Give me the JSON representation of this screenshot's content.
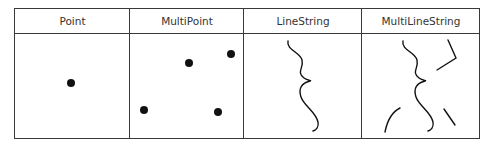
{
  "table": {
    "columns": [
      {
        "label": "Point"
      },
      {
        "label": "MultiPoint"
      },
      {
        "label": "LineString"
      },
      {
        "label": "MultiLineString"
      }
    ]
  },
  "colors": {
    "border": "#3a3a3a",
    "geometry": "#111111",
    "text": "#333333"
  }
}
